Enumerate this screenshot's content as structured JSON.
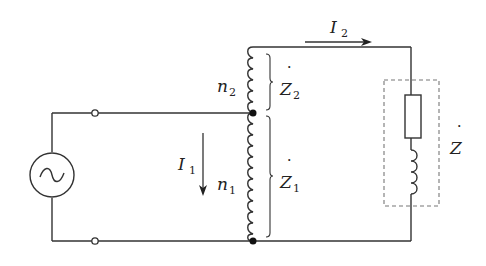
{
  "diagram": {
    "labels": {
      "I2": {
        "main": "I",
        "sub": "2"
      },
      "I1": {
        "main": "I",
        "sub": "1"
      },
      "n2": {
        "main": "n",
        "sub": "2"
      },
      "n1": {
        "main": "n",
        "sub": "1"
      },
      "Z2": {
        "main": "Z",
        "sub": "2",
        "dot": "˙"
      },
      "Z1": {
        "main": "Z",
        "sub": "1",
        "dot": "˙"
      },
      "Z": {
        "main": "Z",
        "dot": "˙"
      }
    },
    "components": [
      {
        "id": "ac-source",
        "type": "ac-voltage-source"
      },
      {
        "id": "terminal-top",
        "type": "terminal"
      },
      {
        "id": "terminal-bottom",
        "type": "terminal"
      },
      {
        "id": "winding-n2",
        "type": "coil"
      },
      {
        "id": "winding-n1",
        "type": "coil"
      },
      {
        "id": "load-resistor",
        "type": "resistor"
      },
      {
        "id": "load-inductor",
        "type": "inductor"
      },
      {
        "id": "load-box",
        "type": "dashed-enclosure"
      }
    ],
    "colors": {
      "line": "#333333",
      "dash": "#777777"
    }
  }
}
